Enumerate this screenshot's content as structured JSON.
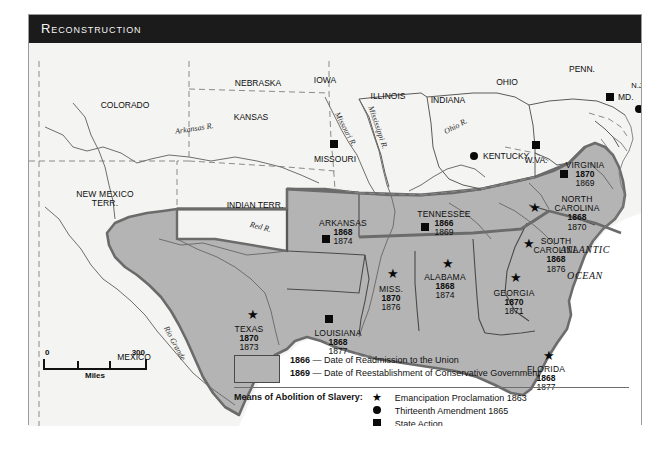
{
  "figure": {
    "title": "Reconstruction"
  },
  "map": {
    "confederate_states": [
      {
        "name": "VIRGINIA",
        "readmission": "1870",
        "conservative": "1869",
        "marker": "square",
        "x": 556,
        "y": 118
      },
      {
        "name": "NORTH\nCAROLINA",
        "readmission": "1868",
        "conservative": "1870",
        "marker": "star",
        "x": 548,
        "y": 155
      },
      {
        "name": "SOUTH\nCAROLINA",
        "readmission": "1868",
        "conservative": "1876",
        "marker": "star",
        "x": 523,
        "y": 196
      },
      {
        "name": "GEORGIA",
        "readmission": "1870",
        "conservative": "1871",
        "marker": "star",
        "x": 481,
        "y": 247
      },
      {
        "name": "FLORIDA",
        "readmission": "1868",
        "conservative": "1877",
        "marker": "star",
        "x": 516,
        "y": 320
      },
      {
        "name": "ALABAMA",
        "readmission": "1868",
        "conservative": "1874",
        "marker": "star",
        "x": 414,
        "y": 231
      },
      {
        "name": "MISS.",
        "readmission": "1870",
        "conservative": "1876",
        "marker": "star",
        "x": 360,
        "y": 242
      },
      {
        "name": "LOUISIANA",
        "readmission": "1868",
        "conservative": "1877",
        "marker": "square",
        "x": 307,
        "y": 285
      },
      {
        "name": "ARKANSAS",
        "readmission": "1868",
        "conservative": "1874",
        "marker": "square",
        "x": 310,
        "y": 177
      },
      {
        "name": "TENNESSEE",
        "readmission": "1866",
        "conservative": "1869",
        "marker": "square",
        "x": 412,
        "y": 172
      },
      {
        "name": "TEXAS",
        "readmission": "1870",
        "conservative": "1873",
        "marker": "star",
        "x": 218,
        "y": 282
      }
    ],
    "other_places": [
      {
        "name": "COLORADO",
        "x": 96,
        "y": 76,
        "marker": "none"
      },
      {
        "name": "NEBRASKA",
        "x": 229,
        "y": 65,
        "marker": "none"
      },
      {
        "name": "IOWA",
        "x": 293,
        "y": 64,
        "marker": "none"
      },
      {
        "name": "ILLINOIS",
        "x": 358,
        "y": 85,
        "marker": "none"
      },
      {
        "name": "INDIANA",
        "x": 417,
        "y": 87,
        "marker": "none"
      },
      {
        "name": "OHIO",
        "x": 477,
        "y": 70,
        "marker": "none"
      },
      {
        "name": "PENN.",
        "x": 553,
        "y": 58,
        "marker": "none"
      },
      {
        "name": "N.J.",
        "x": 608,
        "y": 73,
        "marker": "none"
      },
      {
        "name": "MD.",
        "x": 585,
        "y": 81,
        "marker": "square"
      },
      {
        "name": "DEL.",
        "x": 614,
        "y": 93,
        "marker": "circle"
      },
      {
        "name": "W.VA.",
        "x": 505,
        "y": 121,
        "marker": "square"
      },
      {
        "name": "KENTUCKY",
        "x": 449,
        "y": 142,
        "marker": "circle"
      },
      {
        "name": "MISSOURI",
        "x": 305,
        "y": 141,
        "marker": "square"
      },
      {
        "name": "KANSAS",
        "x": 222,
        "y": 98,
        "marker": "none"
      },
      {
        "name": "INDIAN TERR.",
        "x": 225,
        "y": 187,
        "marker": "none"
      },
      {
        "name": "NEW MEXICO\nTERR.",
        "x": 75,
        "y": 181,
        "marker": "none"
      },
      {
        "name": "MEXICO",
        "x": 104,
        "y": 344,
        "marker": "none"
      }
    ],
    "rivers": [
      {
        "name": "Arkansas R.",
        "x": 143,
        "y": 112,
        "rot": -9
      },
      {
        "name": "Missouri R.",
        "x": 318,
        "y": 100,
        "rot": 62
      },
      {
        "name": "Mississippi R.",
        "x": 350,
        "y": 105,
        "rot": 70
      },
      {
        "name": "Ohio R.",
        "x": 420,
        "y": 113,
        "rot": -28
      },
      {
        "name": "Red R.",
        "x": 228,
        "y": 210,
        "rot": 14
      },
      {
        "name": "Rio Grande",
        "x": 145,
        "y": 318,
        "rot": 62
      }
    ],
    "ocean_label": {
      "line1": "ATLANTIC",
      "line2": "OCEAN",
      "x": 553,
      "y": 236
    }
  },
  "scale": {
    "start": "0",
    "end": "300",
    "unit": "Miles"
  },
  "legend": {
    "swatch_color": "#b4b4b4",
    "date_lines": [
      {
        "year": "1866",
        "dash": "—",
        "text": "Date of Readmission to the Union"
      },
      {
        "year": "1869",
        "dash": "—",
        "text": "Date of Reestablishment of Conservative Government"
      }
    ],
    "means_title": "Means of Abolition of Slavery:",
    "means_items": [
      {
        "glyph": "star",
        "text": "Emancipation Proclamation 1863"
      },
      {
        "glyph": "circle",
        "text": "Thirteenth Amendment 1865"
      },
      {
        "glyph": "square",
        "text": "State Action"
      }
    ]
  }
}
